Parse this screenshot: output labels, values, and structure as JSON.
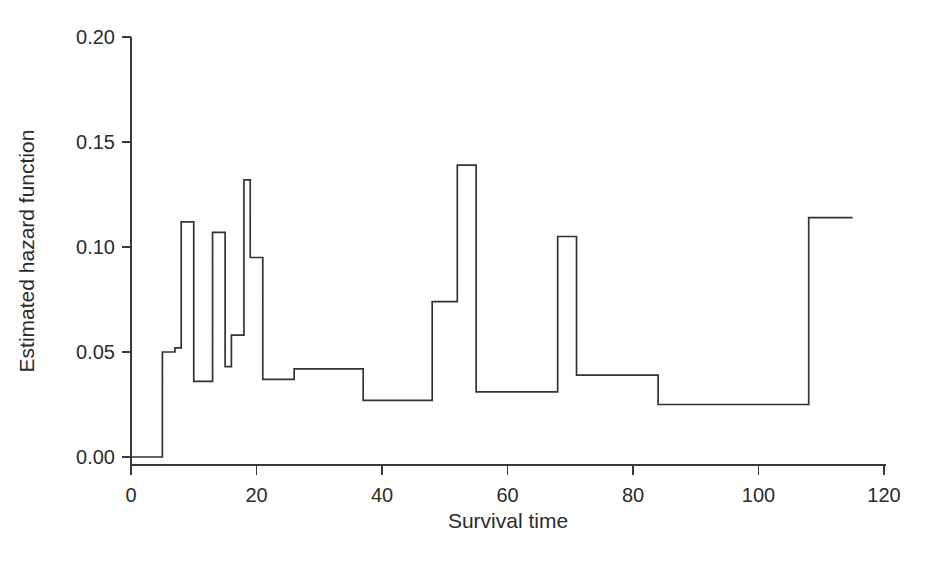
{
  "chart_data": {
    "type": "line",
    "subtype": "step-function",
    "title": "",
    "xlabel": "Survival time",
    "ylabel": "Estimated hazard function",
    "xlim": [
      0,
      120
    ],
    "ylim": [
      0.0,
      0.2
    ],
    "xticks": [
      0,
      20,
      40,
      60,
      80,
      100,
      120
    ],
    "xtick_labels": [
      "0",
      "20",
      "40",
      "60",
      "80",
      "100",
      "120"
    ],
    "yticks": [
      0.0,
      0.05,
      0.1,
      0.15,
      0.2
    ],
    "ytick_labels": [
      "0.00",
      "0.05",
      "0.10",
      "0.15",
      "0.20"
    ],
    "grid": false,
    "legend": null,
    "line_color": "#333333",
    "steps": [
      {
        "x_start": 0,
        "x_end": 5,
        "value": 0.0
      },
      {
        "x_start": 5,
        "x_end": 7,
        "value": 0.05
      },
      {
        "x_start": 7,
        "x_end": 8,
        "value": 0.052
      },
      {
        "x_start": 8,
        "x_end": 10,
        "value": 0.112
      },
      {
        "x_start": 10,
        "x_end": 13,
        "value": 0.036
      },
      {
        "x_start": 13,
        "x_end": 15,
        "value": 0.107
      },
      {
        "x_start": 15,
        "x_end": 16,
        "value": 0.043
      },
      {
        "x_start": 16,
        "x_end": 18,
        "value": 0.058
      },
      {
        "x_start": 18,
        "x_end": 19,
        "value": 0.132
      },
      {
        "x_start": 19,
        "x_end": 21,
        "value": 0.095
      },
      {
        "x_start": 21,
        "x_end": 26,
        "value": 0.037
      },
      {
        "x_start": 26,
        "x_end": 37,
        "value": 0.042
      },
      {
        "x_start": 37,
        "x_end": 48,
        "value": 0.027
      },
      {
        "x_start": 48,
        "x_end": 52,
        "value": 0.074
      },
      {
        "x_start": 52,
        "x_end": 55,
        "value": 0.139
      },
      {
        "x_start": 55,
        "x_end": 68,
        "value": 0.031
      },
      {
        "x_start": 68,
        "x_end": 71,
        "value": 0.105
      },
      {
        "x_start": 71,
        "x_end": 84,
        "value": 0.039
      },
      {
        "x_start": 84,
        "x_end": 108,
        "value": 0.025
      },
      {
        "x_start": 108,
        "x_end": 115,
        "value": 0.114
      }
    ]
  }
}
